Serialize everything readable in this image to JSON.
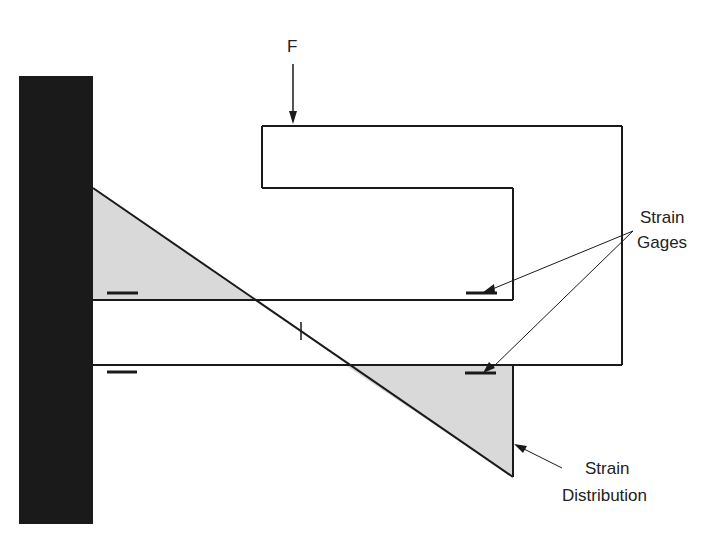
{
  "diagram": {
    "type": "cantilever-beam-strain-diagram",
    "force_label": "F",
    "strain_gages_label": [
      "Strain",
      "Gages"
    ],
    "strain_distribution_label": [
      "Strain",
      "Distribution"
    ]
  },
  "colors": {
    "wall": "#1a1a1a",
    "line": "#1a1a1a",
    "strain_fill": "#d9d9d9",
    "background": "#ffffff",
    "text": "#222222"
  }
}
